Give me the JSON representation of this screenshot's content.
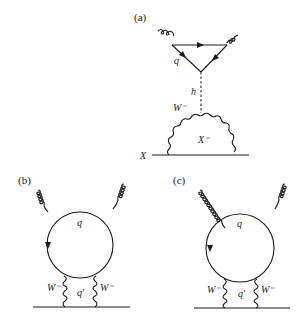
{
  "diagrams": [
    {
      "id": "a",
      "panel_label": "(a)",
      "labels": {
        "quark": "q",
        "higgs": "h",
        "w_boson": "W⁻",
        "fermion_loop": "X⁻",
        "external": "X"
      }
    },
    {
      "id": "b",
      "panel_label": "(b)",
      "labels": {
        "quark_top": "q",
        "quark_bottom": "q′",
        "w_left": "W⁻",
        "w_right": "W⁻"
      }
    },
    {
      "id": "c",
      "panel_label": "(c)",
      "labels": {
        "quark_top": "q",
        "quark_bottom": "q′",
        "w_left": "W⁻",
        "w_right": "W⁻"
      }
    }
  ]
}
